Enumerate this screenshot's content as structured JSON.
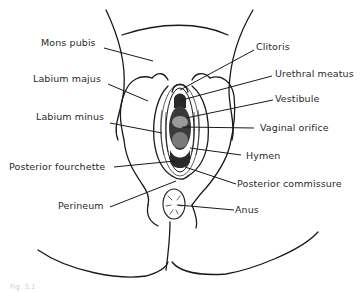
{
  "figure": {
    "type": "anatomical line diagram",
    "line_color": "#1a1a1a",
    "label_color": "#2a2a2a",
    "background": "#ffffff"
  },
  "labels": {
    "mons_pubis": "Mons pubis",
    "labium_majus": "Labium majus",
    "labium_minus": "Labium minus",
    "posterior_fourchette": "Posterior fourchette",
    "perineum": "Perineum",
    "clitoris": "Clitoris",
    "urethral_meatus": "Urethral meatus",
    "vestibule": "Vestibule",
    "vaginal_orifice": "Vaginal orifice",
    "hymen": "Hymen",
    "posterior_commissure": "Posterior commissure",
    "anus": "Anus"
  },
  "caption": "Fig. 3.1"
}
